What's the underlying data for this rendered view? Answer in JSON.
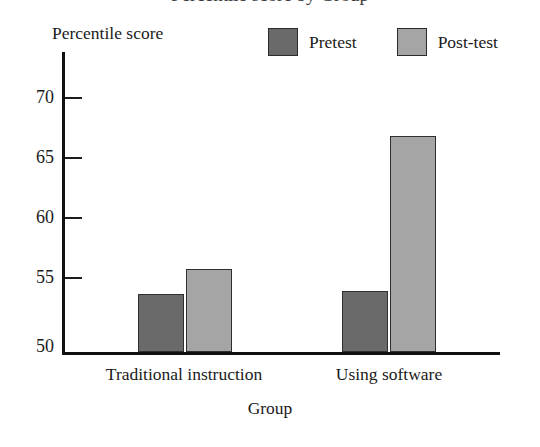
{
  "chart_data": {
    "type": "bar",
    "title": "Percentile score by Group",
    "xlabel": "Group",
    "ylabel": "Percentile score",
    "categories": [
      "Traditional instruction",
      "Using software"
    ],
    "series": [
      {
        "name": "Pretest",
        "color": "#6a6a6a",
        "values": [
          54.8,
          55.1
        ]
      },
      {
        "name": "Post-test",
        "color": "#a5a5a5",
        "values": [
          56.9,
          68.0
        ]
      }
    ],
    "ylim": [
      50,
      72
    ],
    "yticks": [
      50,
      55,
      60,
      65,
      70
    ],
    "ytick_labels": [
      "50",
      "55",
      "60",
      "65",
      "70"
    ],
    "grid": false,
    "legend_position": "top-right",
    "bar_border_color": "#2f2f2f",
    "axis_color": "#111111"
  },
  "axes": {
    "y_title": "Percentile score",
    "x_title": "Group",
    "ticks": [
      {
        "label": "70",
        "value": 70
      },
      {
        "label": "65",
        "value": 65
      },
      {
        "label": "60",
        "value": 60
      },
      {
        "label": "55",
        "value": 55
      },
      {
        "label": "50",
        "value": 50
      }
    ]
  },
  "legend": {
    "entries": [
      {
        "label": "Pretest",
        "color": "#6a6a6a"
      },
      {
        "label": "Post-test",
        "color": "#a5a5a5"
      }
    ]
  },
  "categories": [
    {
      "label": "Traditional instruction"
    },
    {
      "label": "Using software"
    }
  ],
  "title": "Percentile score by Group"
}
